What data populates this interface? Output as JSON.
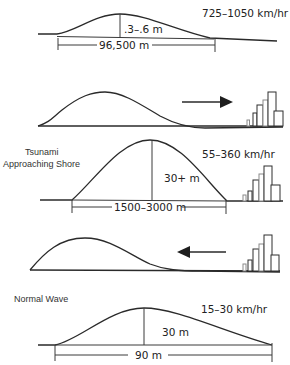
{
  "figure": {
    "panels": [
      {
        "id": "deep-ocean",
        "title": "",
        "speed": "725–1050 km/hr",
        "height_label": ".3–.6 m",
        "wavelength_label": "96,500 m"
      },
      {
        "id": "approaching-outgoing",
        "direction": "toward-shore",
        "arrow_icon": "arrow-right-icon"
      },
      {
        "id": "approaching-shore",
        "title_line1": "Tsunami",
        "title_line2": "Approaching Shore",
        "speed": "55–360 km/hr",
        "height_label": "30+ m",
        "wavelength_label": "1500–3000 m"
      },
      {
        "id": "drawback",
        "direction": "away-from-shore",
        "arrow_icon": "arrow-left-icon"
      },
      {
        "id": "normal-wave",
        "title": "Normal Wave",
        "speed": "15–30 km/hr",
        "height_label": "30 m",
        "wavelength_label": "90 m"
      }
    ],
    "colors": {
      "line": "#2a2a2a",
      "background": "#ffffff",
      "building_light": "#8a8a8a"
    }
  }
}
